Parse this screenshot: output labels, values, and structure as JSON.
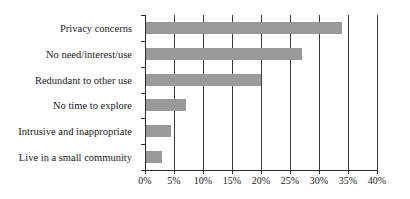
{
  "chart_data": {
    "type": "bar",
    "orientation": "horizontal",
    "title": "",
    "subtitle": "",
    "xlabel": "",
    "ylabel": "",
    "categories": [
      "Privacy concerns",
      "No need/interest/use",
      "Redundant to other use",
      "No time to explore",
      "Intrusive and inappropriate",
      "Live in a small community"
    ],
    "values": [
      34,
      27,
      20,
      7,
      4.5,
      3
    ],
    "value_unit": "%",
    "xlim": [
      0,
      40
    ],
    "xticks": [
      0,
      5,
      10,
      15,
      20,
      25,
      30,
      35,
      40
    ],
    "xtick_labels": [
      "0%",
      "5%",
      "10%",
      "15%",
      "20%",
      "25%",
      "30%",
      "35%",
      "40%"
    ],
    "grid": true,
    "grid_axis": "x",
    "legend": false,
    "legend_position": "none",
    "bar_color": "#9a9a9a",
    "axis_color": "#2a2a2a",
    "text_color": "#1a1a1a"
  }
}
